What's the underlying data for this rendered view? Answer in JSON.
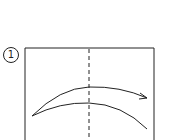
{
  "step": {
    "number": "1"
  },
  "diagram": {
    "type": "origami-fold-instruction",
    "paper": {
      "left": 25,
      "top": 48,
      "right": 154,
      "bottom": 140
    },
    "fold_line": {
      "style": "valley-dashed",
      "x": 89
    },
    "arrow": {
      "direction": "left-to-right",
      "action": "fold in half"
    },
    "stroke_color": "#222222"
  }
}
